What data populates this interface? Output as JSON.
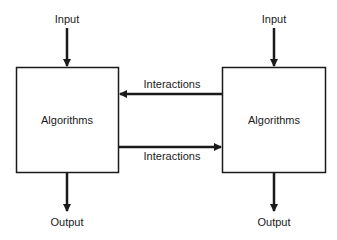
{
  "diagram": {
    "left_block": {
      "input": "Input",
      "label": "Algorithms",
      "output": "Output"
    },
    "right_block": {
      "input": "Input",
      "label": "Algorithms",
      "output": "Output"
    },
    "interactions_top": "Interactions",
    "interactions_bottom": "Interactions",
    "colors": {
      "stroke": "#1a1a1a",
      "background": "#ffffff"
    }
  }
}
